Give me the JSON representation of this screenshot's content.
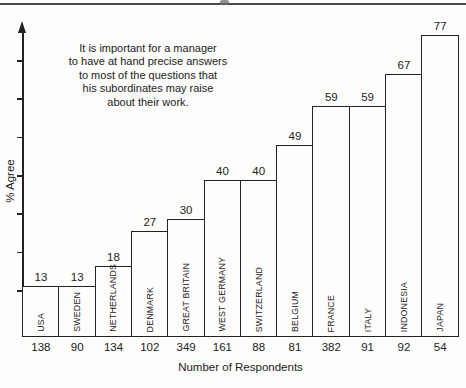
{
  "chart_data": {
    "type": "bar",
    "annotation": "It is important for a manager\nto have at hand precise answers\nto most of the questions that\nhis subordinates may raise\nabout their work.",
    "ylabel": "% Agree",
    "xlabel": "Number of Respondents",
    "categories": [
      "USA",
      "SWEDEN",
      "NETHERLANDS",
      "DENMARK",
      "GREAT BRITAIN",
      "WEST GERMANY",
      "SWITZERLAND",
      "BELGIUM",
      "FRANCE",
      "ITALY",
      "INDONESIA",
      "JAPAN"
    ],
    "values": [
      13,
      13,
      18,
      27,
      30,
      40,
      40,
      49,
      59,
      59,
      67,
      77
    ],
    "respondents": [
      138,
      90,
      134,
      102,
      349,
      161,
      88,
      81,
      382,
      91,
      92,
      54
    ],
    "ylim": [
      0,
      80
    ],
    "y_axis": {
      "tick_count": 7,
      "tick_labels_shown": false
    },
    "bar_fill": "#fdfdfc",
    "line_color": "#222222",
    "legend": "none",
    "grid": false
  }
}
